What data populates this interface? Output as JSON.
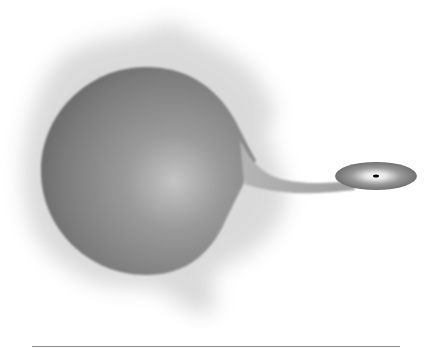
{
  "figure": {
    "colors": {
      "background": "#ffffff",
      "haze": "#bdbdbd",
      "star_edge": "#6e6e6e",
      "star_mid": "#8c8c8c",
      "star_highlight": "#c4c4c4",
      "stream": "#a8a8a8",
      "disk_outer": "#7a7a7a",
      "disk_inner": "#f2f2f2",
      "compact_object": "#000000",
      "rule": "#8a8a8a"
    },
    "donor_star": {
      "cx": 146,
      "cy": 171,
      "rx": 105,
      "ry": 104
    },
    "accretion_disk": {
      "cx": 376,
      "cy": 176,
      "rx": 41,
      "ry": 14
    },
    "compact_object": {
      "cx": 376,
      "cy": 176,
      "rx": 3,
      "ry": 1.5
    }
  }
}
